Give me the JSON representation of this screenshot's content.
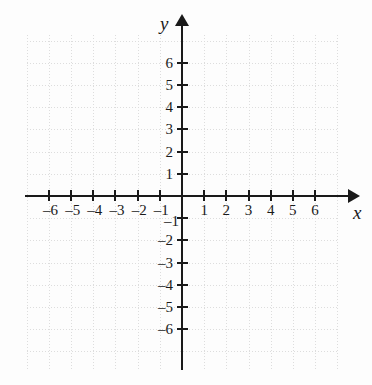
{
  "figure": {
    "kind": "cartesian-coordinate-plane",
    "background_color": "#fdfdfd",
    "axis_color": "#1a1a1a",
    "grid_color": "#c4c4c4",
    "grid_style": "dotted"
  },
  "axes": {
    "x": {
      "name": "x",
      "tick_values": [
        -6,
        -5,
        -4,
        -3,
        -2,
        -1,
        1,
        2,
        3,
        4,
        5,
        6
      ],
      "tick_labels": [
        "–6",
        "–5",
        "–4",
        "–3",
        "–2",
        "–1",
        "1",
        "2",
        "3",
        "4",
        "5",
        "6"
      ],
      "range": [
        -7,
        7
      ],
      "arrow": "right"
    },
    "y": {
      "name": "y",
      "tick_values": [
        6,
        5,
        4,
        3,
        2,
        1,
        -1,
        -2,
        -3,
        -4,
        -5,
        -6
      ],
      "tick_labels": [
        "6",
        "5",
        "4",
        "3",
        "2",
        "1",
        "–1",
        "–2",
        "–3",
        "–4",
        "–5",
        "–6"
      ],
      "range": [
        -7,
        7
      ],
      "arrow": "up"
    }
  },
  "chart_data": {
    "type": "scatter",
    "title": "",
    "xlabel": "x",
    "ylabel": "y",
    "xlim": [
      -7,
      7
    ],
    "ylim": [
      -7,
      7
    ],
    "xticks": [
      -6,
      -5,
      -4,
      -3,
      -2,
      -1,
      1,
      2,
      3,
      4,
      5,
      6
    ],
    "yticks": [
      -6,
      -5,
      -4,
      -3,
      -2,
      -1,
      1,
      2,
      3,
      4,
      5,
      6
    ],
    "xtick_labels": [
      "–6",
      "–5",
      "–4",
      "–3",
      "–2",
      "–1",
      "1",
      "2",
      "3",
      "4",
      "5",
      "6"
    ],
    "ytick_labels": [
      "–6",
      "–5",
      "–4",
      "–3",
      "–2",
      "–1",
      "1",
      "2",
      "3",
      "4",
      "5",
      "6"
    ],
    "grid": true,
    "legend": null,
    "series": [],
    "annotations": [],
    "note": "Empty coordinate grid with no plotted data points or curves."
  }
}
